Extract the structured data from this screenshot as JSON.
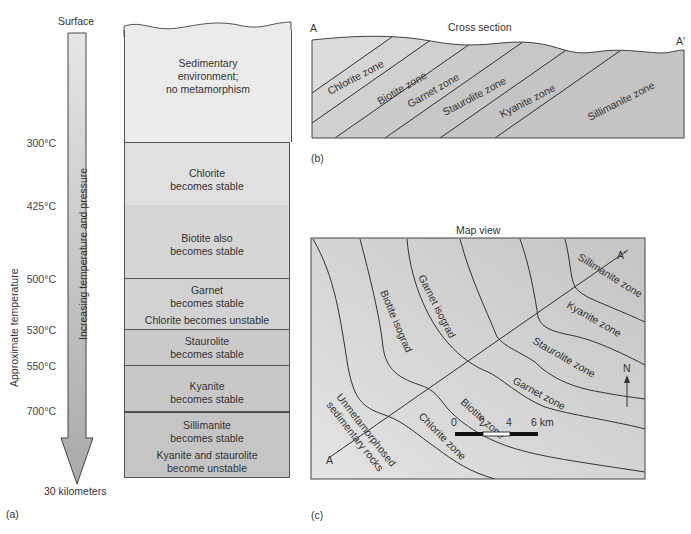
{
  "panel_a": {
    "label": "(a)",
    "surface_label": "Surface",
    "bottom_label": "30 kilometers",
    "axis_label": "Approximate temperature",
    "arrow_label": "Increasing temperature and pressure",
    "temperatures": [
      "300°C",
      "425°C",
      "500°C",
      "530°C",
      "550°C",
      "700°C"
    ],
    "zones": [
      {
        "lines": [
          "Sedimentary",
          "environment;",
          "no metamorphism"
        ],
        "color": "#ebebeb"
      },
      {
        "lines": [
          "Chlorite",
          "becomes stable"
        ],
        "color": "#e0e0e0"
      },
      {
        "lines": [
          "Biotite also",
          "becomes stable"
        ],
        "color": "#d6d6d6"
      },
      {
        "lines": [
          "Garnet",
          "becomes stable",
          "Chlorite becomes unstable"
        ],
        "color": "#d2d2d2"
      },
      {
        "lines": [
          "Staurolite",
          "becomes stable"
        ],
        "color": "#cbcbcb"
      },
      {
        "lines": [
          "Kyanite",
          "becomes stable"
        ],
        "color": "#c8c8c8"
      },
      {
        "lines": [
          "Sillimanite",
          "becomes stable",
          "Kyanite and staurolite",
          "become unstable"
        ],
        "color": "#c5c5c5"
      }
    ]
  },
  "panel_b": {
    "label": "(b)",
    "title": "Cross section",
    "end_left": "A",
    "end_right": "A'",
    "zones": [
      "Chlorite zone",
      "Biotite zone",
      "Garnet zone",
      "Staurolite zone",
      "Kyanite zone",
      "Sillimanite zone"
    ]
  },
  "panel_c": {
    "label": "(c)",
    "title": "Map view",
    "end_left": "A",
    "end_right": "A'",
    "isograds": [
      "Biotite isograd",
      "Garnet isograd"
    ],
    "zones": [
      "Unmetamorphosed sedimentary rocks",
      "Chlorite zone",
      "Biotite zone",
      "Garnet zone",
      "Staurolite zone",
      "Kyanite zone",
      "Sillimanite zone"
    ],
    "unmeta_line1": "Unmetamorphosed",
    "unmeta_line2": "sedimentary rocks",
    "north_label": "N",
    "scale": {
      "ticks": [
        "0",
        "2",
        "4",
        "6 km"
      ]
    }
  }
}
